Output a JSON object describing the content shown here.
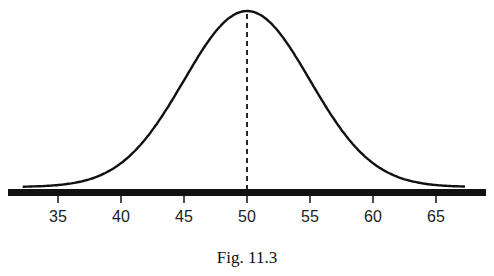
{
  "chart_data": {
    "type": "line",
    "title": "",
    "caption": "Fig. 11.3",
    "xlabel": "",
    "ylabel": "",
    "distribution": "normal",
    "mean": 50,
    "sd": 5,
    "xlim": [
      33.5,
      67.5
    ],
    "x_ticks": [
      35,
      40,
      45,
      50,
      55,
      60,
      65
    ],
    "tick_labels": [
      "35",
      "40",
      "45",
      "50",
      "55",
      "60",
      "65"
    ],
    "annotations": [
      {
        "type": "dashed-vertical-line",
        "x": 50,
        "label": "mean"
      }
    ],
    "grid": false,
    "legend": null
  },
  "figure": {
    "caption": "Fig. 11.3"
  }
}
